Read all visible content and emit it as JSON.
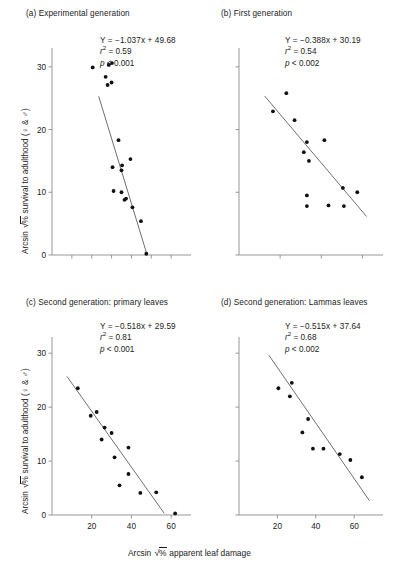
{
  "figure": {
    "axis_x_label_prefix": "Arcsin ",
    "axis_x_label_radical": "√",
    "axis_x_label_under": "%",
    "axis_x_label_suffix": " apparent leaf damage",
    "axis_y_label_prefix": "Arcsin ",
    "axis_y_label_radical": "√",
    "axis_y_label_under": "%",
    "axis_y_label_suffix": " survival to adulthood (♀ & ♂)"
  },
  "chart_data": [
    {
      "id": "a",
      "type": "scatter",
      "title": "(a) Experimental generation",
      "xlabel": "Arcsin √% apparent leaf damage",
      "ylabel": "Arcsin √% survival to adulthood (♀ & ♂)",
      "xlim": [
        0,
        70
      ],
      "ylim": [
        0,
        33
      ],
      "xticks": [
        10,
        20,
        30,
        40,
        50,
        60
      ],
      "xticklabels": [
        "",
        "",
        "",
        "",
        "",
        ""
      ],
      "yticks": [
        0,
        10,
        20,
        30
      ],
      "yticklabels": [
        "0",
        "10",
        "20",
        "30"
      ],
      "grid": false,
      "equation": "Y = −1.037x + 49.68",
      "r2_label": "r",
      "r2_exp": "2",
      "r2_value": " = 0.59",
      "p_italic": "p",
      "p_value": " < 0.001",
      "slope": -1.037,
      "intercept": 49.68,
      "fit_x_range": [
        23.5,
        47.9
      ],
      "points": [
        {
          "x": 20.5,
          "y": 29.9
        },
        {
          "x": 27.0,
          "y": 28.4
        },
        {
          "x": 28.6,
          "y": 30.3
        },
        {
          "x": 30.2,
          "y": 30.6
        },
        {
          "x": 28.0,
          "y": 27.1
        },
        {
          "x": 30.0,
          "y": 27.5
        },
        {
          "x": 33.5,
          "y": 18.3
        },
        {
          "x": 39.5,
          "y": 15.3
        },
        {
          "x": 30.5,
          "y": 14.0
        },
        {
          "x": 35.3,
          "y": 14.3
        },
        {
          "x": 35.0,
          "y": 13.5
        },
        {
          "x": 31.0,
          "y": 10.2
        },
        {
          "x": 35.0,
          "y": 10.0
        },
        {
          "x": 36.5,
          "y": 8.8
        },
        {
          "x": 37.3,
          "y": 9.0
        },
        {
          "x": 40.5,
          "y": 7.6
        },
        {
          "x": 44.8,
          "y": 5.4
        },
        {
          "x": 47.5,
          "y": 0.2
        }
      ]
    },
    {
      "id": "b",
      "type": "scatter",
      "title": "(b) First generation",
      "xlabel": "Arcsin √% apparent leaf damage",
      "ylabel": "Arcsin √% survival to adulthood (♀ & ♂)",
      "xlim": [
        0,
        70
      ],
      "ylim": [
        0,
        33
      ],
      "xticks": [
        20,
        40,
        60
      ],
      "xticklabels": [
        "",
        "",
        ""
      ],
      "yticks": [
        0,
        10,
        20,
        30
      ],
      "yticklabels": [
        "",
        "",
        "",
        ""
      ],
      "grid": false,
      "equation": "Y = −0.388x + 30.19",
      "r2_label": "r",
      "r2_exp": "2",
      "r2_value": " = 0.54",
      "p_italic": "p",
      "p_value": " < 0.002",
      "slope": -0.388,
      "intercept": 30.19,
      "fit_x_range": [
        12.5,
        62.0
      ],
      "points": [
        {
          "x": 23.0,
          "y": 25.8
        },
        {
          "x": 16.5,
          "y": 22.9
        },
        {
          "x": 27.0,
          "y": 21.5
        },
        {
          "x": 33.0,
          "y": 18.0
        },
        {
          "x": 41.5,
          "y": 18.3
        },
        {
          "x": 31.5,
          "y": 16.4
        },
        {
          "x": 34.0,
          "y": 15.0
        },
        {
          "x": 50.5,
          "y": 10.7
        },
        {
          "x": 57.5,
          "y": 10.0
        },
        {
          "x": 33.0,
          "y": 9.5
        },
        {
          "x": 33.0,
          "y": 7.8
        },
        {
          "x": 43.5,
          "y": 7.9
        },
        {
          "x": 51.0,
          "y": 7.8
        }
      ]
    },
    {
      "id": "c",
      "type": "scatter",
      "title": "(c) Second generation: primary leaves",
      "xlabel": "Arcsin √% apparent leaf damage",
      "ylabel": "Arcsin √% survival to adulthood (♀ & ♂)",
      "xlim": [
        0,
        70
      ],
      "ylim": [
        0,
        33
      ],
      "xticks": [
        20,
        40,
        60
      ],
      "xticklabels": [
        "20",
        "40",
        "60"
      ],
      "yticks": [
        0,
        10,
        20,
        30
      ],
      "yticklabels": [
        "0",
        "10",
        "20",
        "30"
      ],
      "grid": false,
      "equation": "Y = −0.518x + 29.59",
      "r2_label": "r",
      "r2_exp": "2",
      "r2_value": " = 0.81",
      "p_italic": "p",
      "p_value": " < 0.001",
      "slope": -0.518,
      "intercept": 29.59,
      "fit_x_range": [
        7.5,
        56.5
      ],
      "points": [
        {
          "x": 13.0,
          "y": 23.5
        },
        {
          "x": 19.5,
          "y": 18.4
        },
        {
          "x": 22.5,
          "y": 19.1
        },
        {
          "x": 26.5,
          "y": 16.2
        },
        {
          "x": 30.0,
          "y": 15.2
        },
        {
          "x": 25.0,
          "y": 14.0
        },
        {
          "x": 38.5,
          "y": 12.5
        },
        {
          "x": 31.5,
          "y": 10.7
        },
        {
          "x": 38.5,
          "y": 7.6
        },
        {
          "x": 34.0,
          "y": 5.5
        },
        {
          "x": 44.5,
          "y": 4.1
        },
        {
          "x": 52.5,
          "y": 4.2
        },
        {
          "x": 62.0,
          "y": 0.3
        }
      ]
    },
    {
      "id": "d",
      "type": "scatter",
      "title": "(d) Second generation: Lammas leaves",
      "xlabel": "Arcsin √% apparent leaf damage",
      "ylabel": "Arcsin √% survival to adulthood (♀ & ♂)",
      "xlim": [
        0,
        75
      ],
      "ylim": [
        0,
        33
      ],
      "xticks": [
        20,
        40,
        60
      ],
      "xticklabels": [
        "20",
        "40",
        "60"
      ],
      "yticks": [
        0,
        10,
        20,
        30
      ],
      "yticklabels": [
        "",
        "",
        "",
        ""
      ],
      "grid": false,
      "equation": "Y = −0.515x + 37.64",
      "r2_label": "r",
      "r2_exp": "2",
      "r2_value": " = 0.68",
      "p_italic": "p",
      "p_value": " < 0.002",
      "slope": -0.515,
      "intercept": 37.64,
      "fit_x_range": [
        15.5,
        68.0
      ],
      "points": [
        {
          "x": 27.5,
          "y": 24.5
        },
        {
          "x": 20.5,
          "y": 23.5
        },
        {
          "x": 26.5,
          "y": 22.0
        },
        {
          "x": 36.0,
          "y": 17.8
        },
        {
          "x": 33.0,
          "y": 15.3
        },
        {
          "x": 38.5,
          "y": 12.3
        },
        {
          "x": 44.0,
          "y": 12.3
        },
        {
          "x": 52.5,
          "y": 11.3
        },
        {
          "x": 58.0,
          "y": 10.2
        },
        {
          "x": 64.0,
          "y": 7.0
        }
      ]
    }
  ]
}
